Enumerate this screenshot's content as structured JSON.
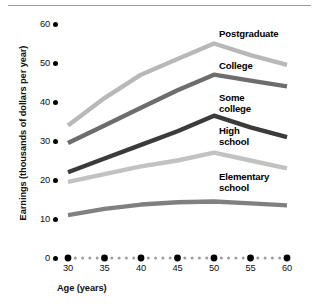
{
  "chart_data": {
    "type": "line",
    "title": "",
    "xlabel": "Age (years)",
    "ylabel": "Earnings (thousands of dollars per year)",
    "xlim": [
      28,
      61
    ],
    "ylim": [
      0,
      60
    ],
    "xticks": [
      30,
      35,
      40,
      45,
      50,
      55,
      60
    ],
    "yticks": [
      0,
      10,
      20,
      30,
      40,
      50,
      60
    ],
    "xtick_labels": [
      "30",
      "35",
      "40",
      "45",
      "50",
      "55",
      "60"
    ],
    "ytick_labels": [
      "0",
      "10",
      "20",
      "30",
      "40",
      "50",
      "60"
    ],
    "grid": false,
    "legend_position": "inline-right",
    "x": [
      30,
      35,
      40,
      45,
      50,
      55,
      60
    ],
    "series": [
      {
        "name": "Postgraduate",
        "label": "Postgraduate",
        "color": "#b8b8b8",
        "values": [
          34.0,
          41.0,
          47.0,
          51.0,
          55.0,
          52.0,
          49.5
        ],
        "label_x": 219,
        "label_y": 29
      },
      {
        "name": "College",
        "label": "College",
        "color": "#6d6d6d",
        "values": [
          29.5,
          34.0,
          38.5,
          43.0,
          47.0,
          45.5,
          44.0
        ],
        "label_x": 219,
        "label_y": 61
      },
      {
        "name": "Some college",
        "label": "Some\ncollege",
        "color": "#3b3b3b",
        "values": [
          22.0,
          25.5,
          29.0,
          32.5,
          36.5,
          33.5,
          31.0
        ],
        "label_x": 219,
        "label_y": 93
      },
      {
        "name": "High school",
        "label": "High\nschool",
        "color": "#c2c2c2",
        "values": [
          19.5,
          21.5,
          23.5,
          25.0,
          27.0,
          25.0,
          23.0
        ],
        "label_x": 219,
        "label_y": 126
      },
      {
        "name": "Elementary school",
        "label": "Elementary\nschool",
        "color": "#808080",
        "values": [
          11.0,
          12.6,
          13.7,
          14.3,
          14.5,
          14.0,
          13.5
        ],
        "label_x": 219,
        "label_y": 172
      }
    ],
    "axis_style": {
      "x_axis_dots": "dotted-with-major-dots",
      "major_dot_color": "#000000",
      "minor_dot_color": "#9d9d9d"
    }
  }
}
